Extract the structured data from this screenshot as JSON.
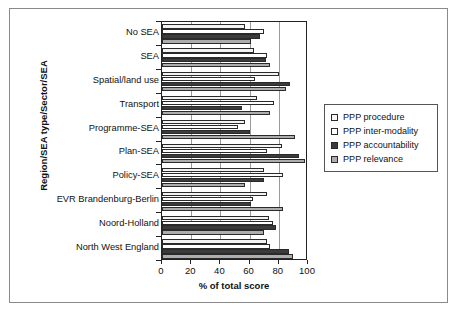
{
  "chart_data": {
    "type": "bar",
    "orientation": "horizontal",
    "title": "",
    "xlabel": "% of total score",
    "ylabel": "Region/SEA type/Sector/SEA",
    "xlim": [
      0,
      100
    ],
    "xticks": [
      0,
      20,
      40,
      60,
      80,
      100
    ],
    "xticklabels": [
      "0",
      "20",
      "40",
      "60",
      "80",
      "100"
    ],
    "grid": true,
    "grid_axis": "x",
    "legend_position": "right",
    "categories": [
      "No SEA",
      "SEA",
      "Spatial/land use",
      "Transport",
      "Programme-SEA",
      "Plan-SEA",
      "Policy-SEA",
      "EVR Brandenburg-Berlin",
      "Noord-Holland",
      "North West England"
    ],
    "series": [
      {
        "name": "PPP procedure",
        "color": "#f3f3f3",
        "values": [
          57,
          63,
          80,
          65,
          57,
          82,
          70,
          72,
          73,
          72
        ]
      },
      {
        "name": "PPP inter-modality",
        "color": "#ffffff",
        "values": [
          70,
          72,
          64,
          77,
          52,
          72,
          83,
          62,
          76,
          74
        ]
      },
      {
        "name": "PPP accountability",
        "color": "#3b3b3b",
        "values": [
          67,
          71,
          88,
          55,
          60,
          94,
          70,
          61,
          78,
          87
        ]
      },
      {
        "name": "PPP relevance",
        "color": "#adadad",
        "values": [
          61,
          74,
          85,
          74,
          91,
          98,
          57,
          83,
          70,
          90
        ]
      }
    ]
  },
  "legend": {
    "items": [
      {
        "label": "PPP procedure"
      },
      {
        "label": "PPP inter-modality"
      },
      {
        "label": "PPP accountability"
      },
      {
        "label": "PPP relevance"
      }
    ]
  }
}
